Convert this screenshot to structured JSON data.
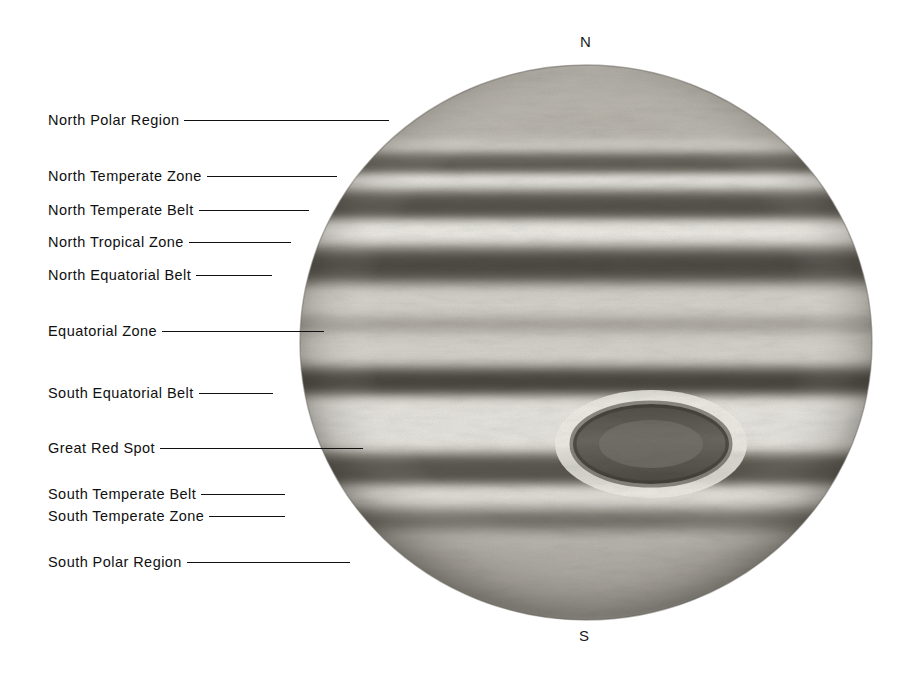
{
  "figure": {
    "background_color": "#ffffff",
    "ink_color": "#101010"
  },
  "poles": {
    "north": "N",
    "south": "S"
  },
  "planet": {
    "name": "jupiter-disc",
    "center_x": 586,
    "center_y": 342,
    "radius_x": 287,
    "radius_y": 278,
    "great_red_spot": {
      "label": "Great Red Spot",
      "center_x": 651,
      "center_y": 444,
      "radius_x": 76,
      "radius_y": 38
    }
  },
  "callouts": [
    {
      "label": "North Polar Region",
      "top": 110,
      "lead_width": 205,
      "anchor_x": 48
    },
    {
      "label": "North Temperate Zone",
      "top": 166,
      "lead_width": 130,
      "anchor_x": 48
    },
    {
      "label": "North Temperate Belt",
      "top": 200,
      "lead_width": 110,
      "anchor_x": 48
    },
    {
      "label": "North Tropical Zone",
      "top": 232,
      "lead_width": 102,
      "anchor_x": 48
    },
    {
      "label": "North Equatorial Belt",
      "top": 265,
      "lead_width": 76,
      "anchor_x": 48
    },
    {
      "label": "Equatorial Zone",
      "top": 321,
      "lead_width": 162,
      "anchor_x": 48
    },
    {
      "label": "South Equatorial Belt",
      "top": 383,
      "lead_width": 74,
      "anchor_x": 48
    },
    {
      "label": "Great Red Spot",
      "top": 438,
      "lead_width": 203,
      "anchor_x": 48
    },
    {
      "label": "South Temperate Belt",
      "top": 484,
      "lead_width": 84,
      "anchor_x": 48
    },
    {
      "label": "South Temperate Zone",
      "top": 506,
      "lead_width": 76,
      "anchor_x": 48
    },
    {
      "label": "South Polar Region",
      "top": 552,
      "lead_width": 163,
      "anchor_x": 48
    }
  ],
  "bands": [
    {
      "name": "north-polar-region",
      "y0": 0.0,
      "y1": 0.145,
      "tone": "#b9b5ad",
      "blur": 9
    },
    {
      "name": "north-temperate-zone-upper",
      "y0": 0.145,
      "y1": 0.16,
      "tone": "#d9d6cf",
      "blur": 6
    },
    {
      "name": "north-temperate-belt-a",
      "y0": 0.16,
      "y1": 0.2,
      "tone": "#636058",
      "blur": 5
    },
    {
      "name": "north-temperate-zone",
      "y0": 0.2,
      "y1": 0.228,
      "tone": "#eceae4",
      "blur": 5
    },
    {
      "name": "north-temperate-belt",
      "y0": 0.228,
      "y1": 0.283,
      "tone": "#56534c",
      "blur": 6
    },
    {
      "name": "north-tropical-zone",
      "y0": 0.283,
      "y1": 0.33,
      "tone": "#eeece6",
      "blur": 6
    },
    {
      "name": "north-equatorial-belt",
      "y0": 0.33,
      "y1": 0.4,
      "tone": "#4e4b45",
      "blur": 7
    },
    {
      "name": "equatorial-zone",
      "y0": 0.4,
      "y1": 0.545,
      "tone": "#d6d3cb",
      "blur": 9
    },
    {
      "name": "equatorial-zone-streak",
      "y0": 0.455,
      "y1": 0.48,
      "tone": "#a5a199",
      "blur": 6
    },
    {
      "name": "south-equatorial-belt",
      "y0": 0.545,
      "y1": 0.6,
      "tone": "#4a4741",
      "blur": 6
    },
    {
      "name": "south-tropical-zone",
      "y0": 0.6,
      "y1": 0.7,
      "tone": "#e7e5df",
      "blur": 7
    },
    {
      "name": "south-temperate-belt",
      "y0": 0.7,
      "y1": 0.76,
      "tone": "#5a574f",
      "blur": 6
    },
    {
      "name": "south-temperate-zone",
      "y0": 0.76,
      "y1": 0.8,
      "tone": "#e4e2db",
      "blur": 6
    },
    {
      "name": "south-temperate-belt-b",
      "y0": 0.8,
      "y1": 0.845,
      "tone": "#6f6c64",
      "blur": 7
    },
    {
      "name": "south-polar-region",
      "y0": 0.845,
      "y1": 1.0,
      "tone": "#b2aea6",
      "blur": 10
    }
  ]
}
